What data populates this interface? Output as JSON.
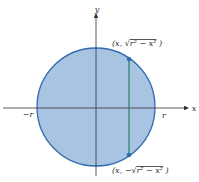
{
  "diagram": {
    "axes": {
      "x_label": "x",
      "y_label": "y"
    },
    "ticks": {
      "neg_r": "−r",
      "pos_r": "r"
    },
    "points": {
      "top": {
        "prefix": "(x, ",
        "radical": "√",
        "expr": "r² − x²",
        "suffix": " )"
      },
      "bottom": {
        "prefix": "(x, −",
        "radical": "√",
        "expr": "r² − x²",
        "suffix": " )"
      }
    },
    "colors": {
      "disk_fill": "#a9c3e2",
      "circle_stroke": "#2f6cae",
      "chord": "#2e7d6b",
      "point": "#2f6cae",
      "axis": "#333333"
    }
  }
}
